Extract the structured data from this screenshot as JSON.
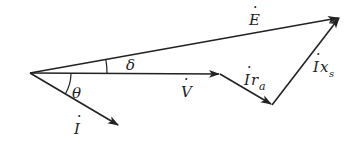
{
  "diagram": {
    "type": "phasor-diagram",
    "stroke_color": "#222222",
    "background": "#ffffff",
    "phasors": [
      {
        "name": "E",
        "label": "E",
        "dot": true,
        "from": [
          30,
          73
        ],
        "to": [
          340,
          17
        ]
      },
      {
        "name": "V",
        "label": "V",
        "dot": true,
        "from": [
          30,
          73
        ],
        "to": [
          220,
          74
        ]
      },
      {
        "name": "I",
        "label": "I",
        "dot": true,
        "from": [
          30,
          73
        ],
        "to": [
          119,
          126
        ]
      },
      {
        "name": "I_ra",
        "label": "I",
        "subscript_main": "r",
        "subscript": "a",
        "dot": true,
        "from": [
          220,
          74
        ],
        "to": [
          272,
          105
        ]
      },
      {
        "name": "I_xs",
        "label": "I",
        "subscript_main": "x",
        "subscript": "s",
        "dot": true,
        "from": [
          272,
          105
        ],
        "to": [
          340,
          17
        ]
      }
    ],
    "angles": [
      {
        "name": "delta",
        "symbol": "δ"
      },
      {
        "name": "theta",
        "symbol": "θ"
      }
    ],
    "labels": {
      "E": "E",
      "V": "V",
      "I": "I",
      "I_ra_main": "I",
      "I_ra_r": "r",
      "I_ra_sub": "a",
      "I_xs_main": "I",
      "I_xs_x": "x",
      "I_xs_sub": "s",
      "delta": "δ",
      "theta": "θ",
      "dot": "·"
    }
  }
}
